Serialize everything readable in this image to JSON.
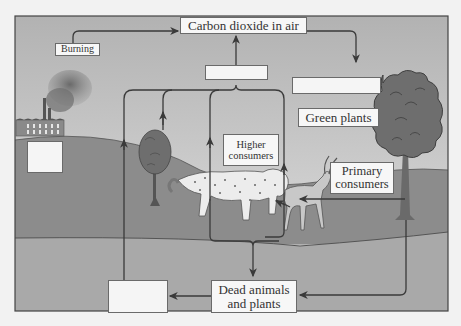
{
  "diagram": {
    "labels": {
      "carbon_dioxide": "Carbon dioxide in air",
      "burning": "Burning",
      "green_plants": "Green plants",
      "higher_consumers_line1": "Higher",
      "higher_consumers_line2": "consumers",
      "primary_consumers_line1": "Primary",
      "primary_consumers_line2": "consumers",
      "dead_line1": "Dead animals",
      "dead_line2": "and plants"
    },
    "blank_boxes": [
      "respiration-blank",
      "photosynthesis-blank",
      "fossil-fuels-blank",
      "decomposers-blank"
    ],
    "nodes": [
      {
        "id": "co2",
        "label": "Carbon dioxide in air"
      },
      {
        "id": "burning",
        "label": "Burning"
      },
      {
        "id": "green_plants",
        "label": "Green plants"
      },
      {
        "id": "primary",
        "label": "Primary consumers"
      },
      {
        "id": "higher",
        "label": "Higher consumers"
      },
      {
        "id": "dead",
        "label": "Dead animals and plants"
      }
    ],
    "colors": {
      "sky_top": "#b4b4b4",
      "sky_bottom": "#d8d8d8",
      "hill": "#8c8c8c",
      "ground": "#a9a9a9",
      "line": "#3a3a3a",
      "box_fill": "#f7f7f7"
    }
  }
}
